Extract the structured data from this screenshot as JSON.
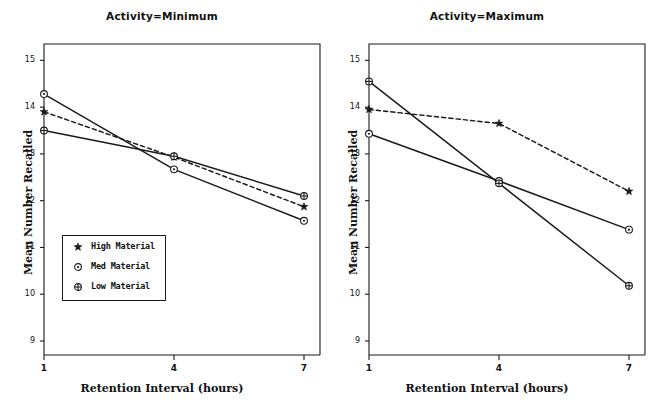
{
  "figure": {
    "background": "#ffffff",
    "ink_color": "#1a1a1a"
  },
  "legend": {
    "entries": [
      {
        "label": "High Material",
        "marker": "star-marker"
      },
      {
        "label": "Med Material",
        "marker": "circle-dot-marker"
      },
      {
        "label": "Low Material",
        "marker": "circle-cross-marker"
      }
    ]
  },
  "panels": [
    {
      "id": "minimum",
      "title": "Activity=Minimum",
      "xlabel": "Retention Interval (hours)",
      "ylabel": "Mean Number Recalled"
    },
    {
      "id": "maximum",
      "title": "Activity=Maximum",
      "xlabel": "Retention Interval (hours)",
      "ylabel": "Mean Number Recalled"
    }
  ],
  "chart_data": [
    {
      "type": "line",
      "title": "Activity=Minimum",
      "xlabel": "Retention Interval (hours)",
      "ylabel": "Mean Number Recalled",
      "categories": [
        "1",
        "4",
        "7"
      ],
      "x": [
        1,
        4,
        7
      ],
      "xticklabels": [
        "1",
        "4",
        "7"
      ],
      "yticklabels": [
        "9",
        "10",
        "11",
        "12",
        "13",
        "14",
        "15"
      ],
      "ylim": [
        8.7,
        15.35
      ],
      "yticks": [
        9,
        10,
        11,
        12,
        13,
        14,
        15
      ],
      "grid": false,
      "legend_position": "lower left",
      "series": [
        {
          "name": "High Material",
          "marker": "star-marker",
          "linestyle": "dashed",
          "values": [
            13.9,
            12.93,
            11.87
          ]
        },
        {
          "name": "Med Material",
          "marker": "circle-dot-marker",
          "linestyle": "solid",
          "values": [
            14.28,
            12.67,
            11.57
          ]
        },
        {
          "name": "Low Material",
          "marker": "circle-cross-marker",
          "linestyle": "solid",
          "values": [
            13.5,
            12.95,
            12.1
          ]
        }
      ]
    },
    {
      "type": "line",
      "title": "Activity=Maximum",
      "xlabel": "Retention Interval (hours)",
      "ylabel": "Mean Number Recalled",
      "categories": [
        "1",
        "4",
        "7"
      ],
      "x": [
        1,
        4,
        7
      ],
      "xticklabels": [
        "1",
        "4",
        "7"
      ],
      "yticklabels": [
        "9",
        "10",
        "11",
        "12",
        "13",
        "14",
        "15"
      ],
      "ylim": [
        8.7,
        15.35
      ],
      "yticks": [
        9,
        10,
        11,
        12,
        13,
        14,
        15
      ],
      "grid": false,
      "legend_position": "none",
      "series": [
        {
          "name": "High Material",
          "marker": "star-marker",
          "linestyle": "dashed",
          "values": [
            13.95,
            13.65,
            12.2
          ]
        },
        {
          "name": "Med Material",
          "marker": "circle-dot-marker",
          "linestyle": "solid",
          "values": [
            13.43,
            12.42,
            11.38
          ]
        },
        {
          "name": "Low Material",
          "marker": "circle-cross-marker",
          "linestyle": "solid",
          "values": [
            14.55,
            12.37,
            10.18
          ]
        }
      ]
    }
  ]
}
